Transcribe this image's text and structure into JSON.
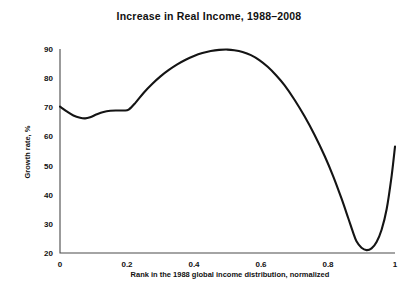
{
  "chart_data": {
    "type": "line",
    "title": "Increase in Real Income, 1988–2008",
    "xlabel": "Rank in the 1988 global income distribution, normalized",
    "ylabel": "Growth rate, %",
    "xlim": [
      0,
      1
    ],
    "ylim": [
      20,
      90
    ],
    "grid": false,
    "legend": false,
    "xticks": [
      0,
      0.2,
      0.4,
      0.6,
      0.8,
      1
    ],
    "xtick_labels": [
      "0",
      "0.2",
      "0.4",
      "0.6",
      "0.8",
      "1"
    ],
    "yticks": [
      20,
      30,
      40,
      50,
      60,
      70,
      80,
      90
    ],
    "ytick_labels": [
      "20",
      "30",
      "40",
      "50",
      "60",
      "70",
      "80",
      "90"
    ],
    "series": [
      {
        "name": "Growth rate",
        "color": "#141414",
        "x": [
          0.0,
          0.02,
          0.04,
          0.06,
          0.075,
          0.09,
          0.11,
          0.13,
          0.15,
          0.17,
          0.19,
          0.205,
          0.225,
          0.25,
          0.275,
          0.3,
          0.325,
          0.35,
          0.375,
          0.4,
          0.425,
          0.45,
          0.475,
          0.5,
          0.52,
          0.545,
          0.57,
          0.595,
          0.62,
          0.645,
          0.67,
          0.7,
          0.73,
          0.76,
          0.79,
          0.815,
          0.84,
          0.86,
          0.875,
          0.885,
          0.9,
          0.915,
          0.93,
          0.945,
          0.96,
          0.975,
          0.99,
          1.0
        ],
        "y": [
          70.2,
          68.6,
          67.2,
          66.4,
          66.2,
          66.6,
          67.6,
          68.4,
          68.8,
          68.9,
          68.9,
          69.2,
          71.5,
          75.0,
          78.0,
          80.6,
          82.8,
          84.7,
          86.3,
          87.6,
          88.6,
          89.3,
          89.7,
          89.8,
          89.6,
          89.0,
          87.9,
          86.2,
          83.9,
          81.0,
          77.6,
          72.6,
          66.9,
          60.5,
          53.3,
          46.5,
          38.8,
          32.1,
          27.0,
          24.0,
          21.8,
          21.0,
          21.6,
          23.8,
          28.0,
          35.0,
          46.5,
          56.5
        ]
      }
    ]
  }
}
